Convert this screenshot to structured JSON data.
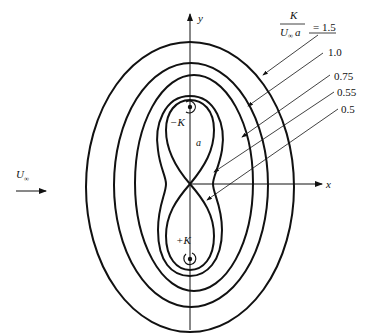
{
  "diagram": {
    "axes": {
      "x_label": "x",
      "y_label": "y"
    },
    "freestream": {
      "label": "U",
      "label_subscript": "∞"
    },
    "parameter": {
      "numerator": "K",
      "denominator_main": "U",
      "denominator_sub": "∞",
      "denominator_tail": "a",
      "equals": "= 1.5"
    },
    "contours": [
      {
        "value": "= 1.5",
        "shape": "outer-ellipse"
      },
      {
        "value": "1.0",
        "shape": "ellipse"
      },
      {
        "value": "0.75",
        "shape": "ellipse"
      },
      {
        "value": "0.55",
        "shape": "peanut"
      },
      {
        "value": "0.5",
        "shape": "figure-eight"
      }
    ],
    "vortices": {
      "upper": {
        "label": "−K"
      },
      "lower": {
        "label": "+K"
      }
    },
    "spacing_label": "a"
  }
}
